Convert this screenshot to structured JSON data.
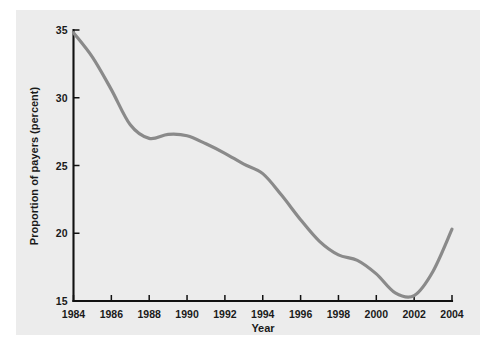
{
  "chart_data": {
    "type": "line",
    "title": "",
    "xlabel": "Year",
    "ylabel": "Proportion of payers (percent)",
    "xlim": [
      1984,
      2004
    ],
    "ylim": [
      15,
      35
    ],
    "grid": false,
    "legend": false,
    "line_color": "#8a8a8a",
    "background_color": "#ececec",
    "xticks": [
      1984,
      1986,
      1988,
      1990,
      1992,
      1994,
      1996,
      1998,
      2000,
      2002,
      2004
    ],
    "xtick_labels": [
      "1984",
      "1986",
      "1988",
      "1990",
      "1992",
      "1994",
      "1996",
      "1998",
      "2000",
      "2002",
      "2004"
    ],
    "yticks": [
      15,
      20,
      25,
      30,
      35
    ],
    "ytick_labels": [
      "15",
      "20",
      "25",
      "30",
      "35"
    ],
    "series": [
      {
        "name": "Proportion of payers",
        "x": [
          1984,
          1985,
          1986,
          1987,
          1988,
          1989,
          1990,
          1991,
          1992,
          1993,
          1994,
          1995,
          1996,
          1997,
          1998,
          1999,
          2000,
          2001,
          2002,
          2003,
          2004
        ],
        "values": [
          34.8,
          33.0,
          30.6,
          28.0,
          27.0,
          27.3,
          27.2,
          26.6,
          25.9,
          25.1,
          24.4,
          22.8,
          21.0,
          19.4,
          18.4,
          18.0,
          17.0,
          15.6,
          15.4,
          17.2,
          20.3
        ]
      }
    ]
  },
  "axes": {
    "y_axis_title": "Proportion of payers (percent)",
    "x_axis_title": "Year"
  }
}
